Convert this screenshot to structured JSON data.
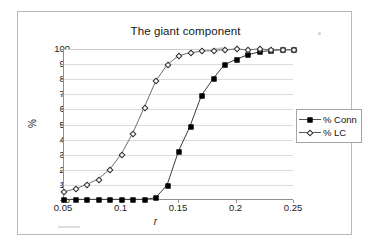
{
  "chart_data": {
    "type": "line",
    "title": "The giant component",
    "xlabel": "r",
    "ylabel": "%",
    "xlim": [
      0.05,
      0.25
    ],
    "ylim": [
      0,
      100
    ],
    "grid": true,
    "legend_position": "right",
    "xticks": [
      "0.05",
      "0.1",
      "0.15",
      "0.2",
      "0.25"
    ],
    "xtick_values": [
      0.05,
      0.1,
      0.15,
      0.2,
      0.25
    ],
    "yticks": [
      "0",
      "10",
      "20",
      "30",
      "40",
      "50",
      "60",
      "70",
      "80",
      "90",
      "100"
    ],
    "ytick_values": [
      0,
      10,
      20,
      30,
      40,
      50,
      60,
      70,
      80,
      90,
      100
    ],
    "x": [
      0.05,
      0.06,
      0.07,
      0.08,
      0.09,
      0.1,
      0.11,
      0.12,
      0.13,
      0.14,
      0.15,
      0.16,
      0.17,
      0.18,
      0.19,
      0.2,
      0.21,
      0.22,
      0.23,
      0.24,
      0.25
    ],
    "series": [
      {
        "name": "% Conn",
        "marker": "filled-square",
        "color": "#000000",
        "values": [
          0,
          0,
          0,
          0,
          0,
          0,
          0,
          0,
          1,
          9.5,
          32,
          48.5,
          69,
          80,
          89.5,
          93,
          96,
          98,
          99,
          99.5,
          99.5
        ]
      },
      {
        "name": "% LC",
        "marker": "open-diamond",
        "color": "#2b2b2b",
        "values": [
          5,
          7,
          10,
          13.5,
          20,
          30,
          44,
          61,
          78.5,
          89.5,
          95.5,
          97.5,
          98.5,
          99,
          99.5,
          100,
          99.5,
          100,
          99.5,
          99.5,
          99.5
        ]
      }
    ]
  },
  "legend": {
    "items": [
      {
        "label": "% Conn"
      },
      {
        "label": "% LC"
      }
    ]
  }
}
